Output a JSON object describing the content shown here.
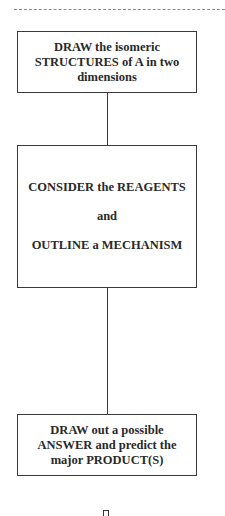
{
  "diagram": {
    "type": "flowchart",
    "steps": [
      {
        "lines": [
          "DRAW the isomeric",
          "STRUCTURES of A in two",
          "dimensions"
        ]
      },
      {
        "lines": [
          "CONSIDER the REAGENTS",
          "and",
          "OUTLINE a MECHANISM"
        ]
      },
      {
        "lines": [
          "DRAW out a possible",
          "ANSWER and predict the",
          "major PRODUCT(S)"
        ]
      }
    ],
    "colors": {
      "border": "#3a3a3a",
      "text": "#2a2a2a",
      "dashed_rule": "#8a8a8a",
      "background": "#ffffff"
    }
  }
}
